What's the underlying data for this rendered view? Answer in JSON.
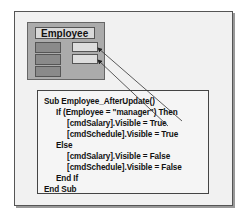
{
  "diagram": {
    "form": {
      "title": "Employee",
      "left_buttons": 3,
      "right_textboxes": 2
    },
    "code": {
      "lines": [
        "Sub Employee_AfterUpdate()",
        "If (Employee = \"manager\") Then",
        "[cmdSalary].Visible = True",
        "[cmdSchedule].Visible = True",
        "Else",
        "[cmdSalary].Visible = False",
        "[cmdSchedule].Visible = False",
        "End If",
        "End Sub"
      ]
    },
    "arrows": [
      {
        "from": "code-line-3",
        "to": "right-textbox-1"
      },
      {
        "from": "code-line-4",
        "to": "right-textbox-2"
      }
    ]
  }
}
